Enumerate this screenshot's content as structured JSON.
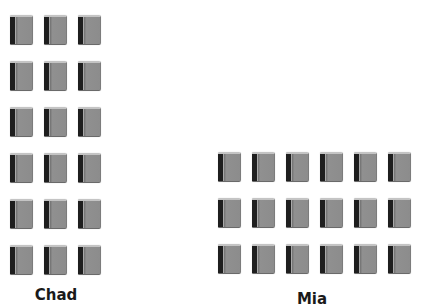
{
  "figure": {
    "icon": "book-icon",
    "colors": {
      "book_body": "#8c8c8c",
      "book_spine": "#1e1e1e",
      "label": "#1a1a1a",
      "background": "#ffffff"
    },
    "groups": [
      {
        "name": "Chad",
        "label": "Chad",
        "rows": 6,
        "columns": 3,
        "count": 18,
        "origin": {
          "x": 10,
          "y": 15
        },
        "label_pos": {
          "x": 56,
          "y": 286
        }
      },
      {
        "name": "Mia",
        "label": "Mia",
        "rows": 3,
        "columns": 6,
        "count": 18,
        "origin": {
          "x": 218,
          "y": 152
        },
        "label_pos": {
          "x": 312,
          "y": 290
        }
      }
    ],
    "spacing": {
      "col_pitch": 34,
      "row_pitch": 46
    }
  }
}
